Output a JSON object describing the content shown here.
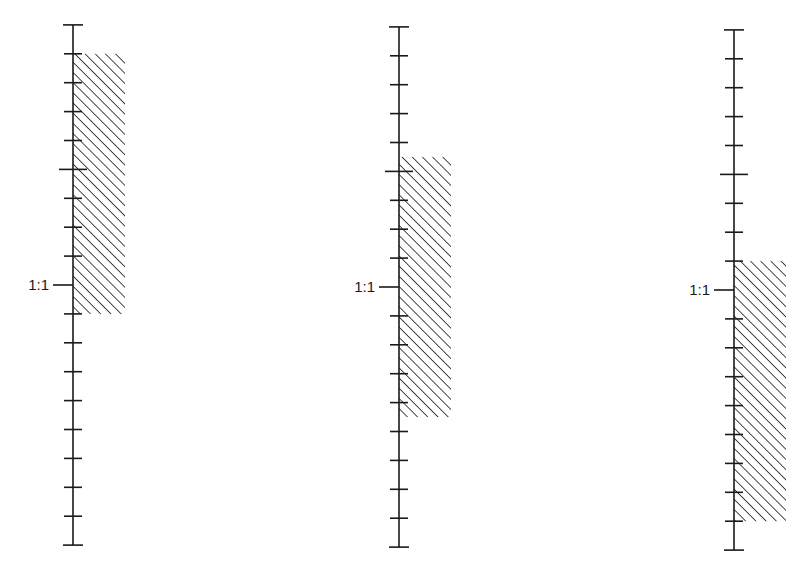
{
  "diagram": {
    "tick_spacing_px": 28.9,
    "reference_label": "1:1",
    "hatch_color": "#1a1a1a",
    "line_color": "#1a1a1a",
    "scales": [
      {
        "id": "scale-1",
        "axis_x": 73,
        "top_y": 24,
        "one_to_one_y": 285,
        "ticks_above": 9,
        "ticks_below": 9,
        "major_tick_offsets": [
          -4,
          0
        ],
        "label": "1:1",
        "hatch": {
          "from_offset": -8,
          "to_offset": 1,
          "width": 52
        }
      },
      {
        "id": "scale-2",
        "axis_x": 399,
        "top_y": 27,
        "one_to_one_y": 287,
        "ticks_above": 9,
        "ticks_below": 9,
        "major_tick_offsets": [
          -4,
          0
        ],
        "label": "1:1",
        "hatch": {
          "from_offset": -4.5,
          "to_offset": 4.5,
          "width": 52
        }
      },
      {
        "id": "scale-3",
        "axis_x": 734,
        "top_y": 30,
        "one_to_one_y": 290,
        "ticks_above": 9,
        "ticks_below": 9,
        "major_tick_offsets": [
          -4,
          0
        ],
        "label": "1:1",
        "hatch": {
          "from_offset": -1,
          "to_offset": 8,
          "width": 52
        }
      }
    ]
  }
}
